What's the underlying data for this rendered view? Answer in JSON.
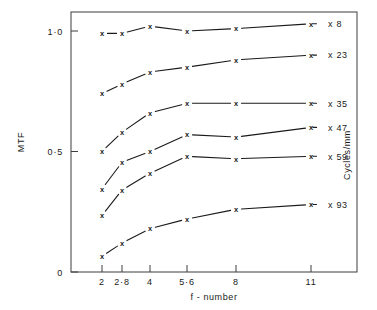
{
  "chart_data": {
    "type": "line",
    "title": "",
    "subtitle": "",
    "xlabel": "f - number",
    "ylabel": "MTF",
    "secondary_axis_label": "Cycles/mm",
    "x_tick_labels": [
      "2",
      "2·8",
      "4",
      "5·6",
      "8",
      "11"
    ],
    "x_values": [
      2,
      2.8,
      4,
      5.6,
      8,
      11
    ],
    "x_scale": "log",
    "y_tick_labels": [
      "0",
      "0·5",
      "1·0"
    ],
    "y_ticks": [
      0,
      0.5,
      1.0
    ],
    "ylim": [
      0,
      1.08
    ],
    "grid": false,
    "legend_position": "right-inline",
    "marker": "x",
    "series": [
      {
        "name": "8",
        "label": "x 8",
        "categories": [
          "2",
          "2·8",
          "4",
          "5·6",
          "8",
          "11"
        ],
        "values": [
          0.99,
          0.99,
          1.02,
          1.0,
          1.01,
          1.03
        ]
      },
      {
        "name": "23",
        "label": "x 23",
        "categories": [
          "2",
          "2·8",
          "4",
          "5·6",
          "8",
          "11"
        ],
        "values": [
          0.74,
          0.78,
          0.83,
          0.85,
          0.88,
          0.9
        ]
      },
      {
        "name": "35",
        "label": "x 35",
        "categories": [
          "2",
          "2·8",
          "4",
          "5·6",
          "8",
          "11"
        ],
        "values": [
          0.5,
          0.58,
          0.66,
          0.7,
          0.7,
          0.7
        ]
      },
      {
        "name": "47",
        "label": "x 47",
        "categories": [
          "2",
          "2·8",
          "4",
          "5·6",
          "8",
          "11"
        ],
        "values": [
          0.345,
          0.455,
          0.5,
          0.57,
          0.56,
          0.6
        ]
      },
      {
        "name": "59",
        "label": "x 59",
        "categories": [
          "2",
          "2·8",
          "4",
          "5·6",
          "8",
          "11"
        ],
        "values": [
          0.235,
          0.34,
          0.41,
          0.48,
          0.47,
          0.48
        ]
      },
      {
        "name": "93",
        "label": "x 93",
        "categories": [
          "2",
          "2·8",
          "4",
          "5·6",
          "8",
          "11"
        ],
        "values": [
          0.065,
          0.12,
          0.18,
          0.22,
          0.26,
          0.28
        ]
      }
    ],
    "colors": {
      "line": "#1a1a1a",
      "axis": "#3d3d3d",
      "background": "#ffffff"
    }
  },
  "geometry": {
    "plot_left": 71,
    "plot_right": 357,
    "plot_top": 12,
    "plot_bottom": 272,
    "x_pixels": [
      102,
      122,
      150,
      187,
      236,
      311
    ],
    "y_zero": 272,
    "y_unit_px": 241,
    "label_x": 318,
    "label_text_x": 328
  }
}
